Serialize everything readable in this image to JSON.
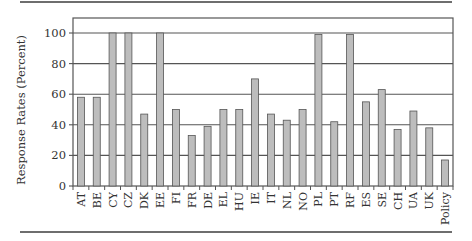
{
  "chart_data": {
    "type": "bar",
    "title": "",
    "xlabel": "",
    "ylabel": "Response Rates (Percent)",
    "ylim": [
      0,
      110
    ],
    "yticks": [
      0,
      20,
      40,
      60,
      80,
      100
    ],
    "grid": true,
    "legend": null,
    "categories": [
      "AT",
      "BE",
      "CY",
      "CZ",
      "DK",
      "EE",
      "FI",
      "FR",
      "DE",
      "EL",
      "HU",
      "IE",
      "IT",
      "NL",
      "NO",
      "PL",
      "PT",
      "RF",
      "ES",
      "SE",
      "CH",
      "UA",
      "UK",
      "Policy"
    ],
    "values": [
      58,
      58,
      100,
      100,
      47,
      100,
      50,
      33,
      39,
      50,
      50,
      70,
      47,
      43,
      50,
      99,
      42,
      99,
      55,
      63,
      37,
      49,
      38,
      17
    ],
    "colors": {
      "bar_fill": "#bdbdbd",
      "bar_stroke": "#555555",
      "grid": "#555555",
      "axis": "#555555",
      "text": "#333333"
    }
  }
}
